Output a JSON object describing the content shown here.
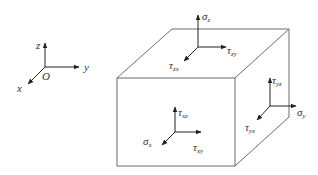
{
  "figure": {
    "type": "stress element diagram"
  },
  "axes": {
    "origin_label": "O",
    "x_label": "x",
    "y_label": "y",
    "z_label": "z"
  },
  "faces": {
    "top": {
      "normal": {
        "symbol": "σ",
        "sub": "z"
      },
      "shear1": {
        "symbol": "τ",
        "sub": "zx"
      },
      "shear2": {
        "symbol": "τ",
        "sub": "zy"
      }
    },
    "front": {
      "normal": {
        "symbol": "σ",
        "sub": "x"
      },
      "shear1": {
        "symbol": "τ",
        "sub": "xz"
      },
      "shear2": {
        "symbol": "τ",
        "sub": "xy"
      }
    },
    "right": {
      "normal": {
        "symbol": "σ",
        "sub": "y"
      },
      "shear1": {
        "symbol": "τ",
        "sub": "yz"
      },
      "shear2": {
        "symbol": "τ",
        "sub": "yx"
      }
    }
  },
  "colors": {
    "edge": "#6b6b6b",
    "arrow": "#222222",
    "text": "#333333"
  }
}
